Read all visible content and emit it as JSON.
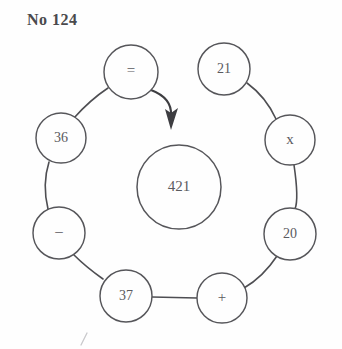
{
  "page": {
    "title": "No 124",
    "background_color": "#fefefe",
    "ink_color": "#56565a",
    "width": 342,
    "height": 349
  },
  "diagram": {
    "type": "circular-equation-puzzle",
    "center_node": {
      "label": "421",
      "cx": 179,
      "cy": 187,
      "r": 42
    },
    "ring_nodes": [
      {
        "id": "equals",
        "label": "=",
        "kind": "operator",
        "cx": 131,
        "cy": 72,
        "r": 27
      },
      {
        "id": "n21",
        "label": "21",
        "kind": "number",
        "cx": 224,
        "cy": 69,
        "r": 26
      },
      {
        "id": "times",
        "label": "x",
        "kind": "operator",
        "cx": 290,
        "cy": 140,
        "r": 25
      },
      {
        "id": "n20",
        "label": "20",
        "kind": "number",
        "cx": 290,
        "cy": 234,
        "r": 26
      },
      {
        "id": "plus",
        "label": "+",
        "kind": "operator",
        "cx": 222,
        "cy": 298,
        "r": 25
      },
      {
        "id": "n37",
        "label": "37",
        "kind": "number",
        "cx": 126,
        "cy": 296,
        "r": 26
      },
      {
        "id": "minus",
        "label": "–",
        "kind": "operator",
        "cx": 59,
        "cy": 233,
        "r": 26
      },
      {
        "id": "n36",
        "label": "36",
        "kind": "number",
        "cx": 61,
        "cy": 138,
        "r": 25
      }
    ],
    "connectors": [
      {
        "from": "n21",
        "to": "times"
      },
      {
        "from": "times",
        "to": "n20"
      },
      {
        "from": "n20",
        "to": "plus"
      },
      {
        "from": "plus",
        "to": "n37"
      },
      {
        "from": "n37",
        "to": "minus"
      },
      {
        "from": "minus",
        "to": "n36"
      },
      {
        "from": "n36",
        "to": "equals"
      }
    ],
    "arrow": {
      "from": "equals",
      "to": "center_node",
      "description": "curved arrow pointing inward to the center circle"
    }
  }
}
